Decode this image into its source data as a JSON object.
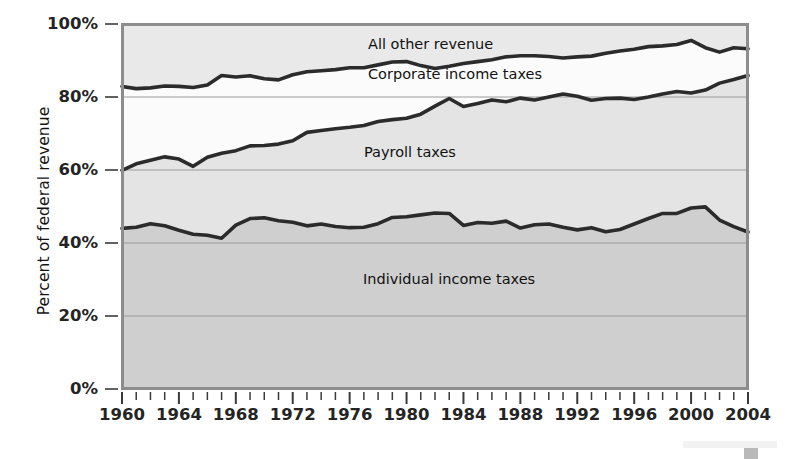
{
  "figure": {
    "background_color": "#ffffff",
    "plot_area": {
      "left": 122,
      "top": 24,
      "right": 748,
      "bottom": 389
    },
    "border_color": "#8d8d8d",
    "gridline_color": "#9a9a9a",
    "line_color": "#2b2b2b"
  },
  "axes": {
    "y_title": "Percent of federal revenue",
    "y_ticks": [
      "0%",
      "20%",
      "40%",
      "60%",
      "80%",
      "100%"
    ],
    "y_tick_values": [
      0,
      20,
      40,
      60,
      80,
      100
    ],
    "x_ticks": [
      "1960",
      "1964",
      "1968",
      "1972",
      "1976",
      "1980",
      "1984",
      "1988",
      "1992",
      "1996",
      "2000",
      "2004"
    ],
    "x_tick_values": [
      1960,
      1964,
      1968,
      1972,
      1976,
      1980,
      1984,
      1988,
      1992,
      1996,
      2000,
      2004
    ],
    "x_minor_tick_step": 1
  },
  "bands": [
    {
      "name": "individual-income-taxes",
      "label": "Individual income taxes",
      "fill": "#cfcfcf",
      "label_x": 363,
      "label_y": 272
    },
    {
      "name": "payroll-taxes",
      "label": "Payroll taxes",
      "fill": "#e4e4e4",
      "label_x": 364,
      "label_y": 145
    },
    {
      "name": "corporate-income-taxes",
      "label": "Corporate income taxes",
      "fill": "#fbfbfb",
      "label_x": 368,
      "label_y": 67
    },
    {
      "name": "all-other-revenue",
      "label": "All other revenue",
      "fill": "#e9e9e9",
      "label_x": 368,
      "label_y": 37
    }
  ],
  "chart_data": {
    "type": "area",
    "title": "",
    "subtitle": "",
    "xlabel": "",
    "ylabel": "Percent of federal revenue",
    "xlim": [
      1960,
      2004
    ],
    "ylim": [
      0,
      100
    ],
    "grid": true,
    "stacked": true,
    "legend_position": "inline-labels",
    "x": [
      1960,
      1961,
      1962,
      1963,
      1964,
      1965,
      1966,
      1967,
      1968,
      1969,
      1970,
      1971,
      1972,
      1973,
      1974,
      1975,
      1976,
      1977,
      1978,
      1979,
      1980,
      1981,
      1982,
      1983,
      1984,
      1985,
      1986,
      1987,
      1988,
      1989,
      1990,
      1991,
      1992,
      1993,
      1994,
      1995,
      1996,
      1997,
      1998,
      1999,
      2000,
      2001,
      2002,
      2003,
      2004
    ],
    "annotations": [
      {
        "text": "All other revenue",
        "x": 1977,
        "y": 95
      },
      {
        "text": "Corporate income taxes",
        "x": 1977,
        "y": 87
      },
      {
        "text": "Payroll taxes",
        "x": 1977,
        "y": 67
      },
      {
        "text": "Individual income taxes",
        "x": 1977,
        "y": 32
      }
    ],
    "cumulative_boundaries": {
      "individual_top": [
        44.0,
        44.3,
        45.3,
        44.7,
        43.5,
        42.4,
        42.1,
        41.3,
        44.9,
        46.7,
        46.9,
        46.1,
        45.7,
        44.7,
        45.2,
        44.5,
        44.2,
        44.3,
        45.3,
        47.0,
        47.2,
        47.7,
        48.2,
        48.1,
        44.8,
        45.6,
        45.4,
        46.0,
        44.1,
        45.0,
        45.2,
        44.3,
        43.6,
        44.2,
        43.1,
        43.7,
        45.2,
        46.7,
        48.1,
        48.1,
        49.6,
        49.9,
        46.3,
        44.5,
        43.0
      ],
      "payroll_top": [
        59.9,
        61.7,
        62.7,
        63.6,
        63.0,
        61.0,
        63.5,
        64.6,
        65.3,
        66.6,
        66.7,
        67.1,
        68.0,
        70.3,
        70.8,
        71.3,
        71.7,
        72.2,
        73.3,
        73.8,
        74.2,
        75.3,
        77.5,
        79.6,
        77.4,
        78.2,
        79.2,
        78.7,
        79.7,
        79.2,
        80.0,
        80.8,
        80.2,
        79.1,
        79.6,
        79.7,
        79.3,
        80.0,
        80.8,
        81.5,
        81.1,
        81.9,
        83.8,
        84.8,
        85.9
      ],
      "corporate_top": [
        82.9,
        82.3,
        82.5,
        83.0,
        82.9,
        82.6,
        83.3,
        85.9,
        85.5,
        85.8,
        85.0,
        84.7,
        86.1,
        86.9,
        87.2,
        87.5,
        88.0,
        88.0,
        88.8,
        89.6,
        89.7,
        88.6,
        87.8,
        88.4,
        89.2,
        89.7,
        90.2,
        91.0,
        91.3,
        91.3,
        91.1,
        90.7,
        91.0,
        91.2,
        92.0,
        92.6,
        93.1,
        93.8,
        94.0,
        94.4,
        95.5,
        93.5,
        92.3,
        93.5,
        93.2
      ]
    },
    "series": [
      {
        "name": "Individual income taxes",
        "fill": "#cfcfcf"
      },
      {
        "name": "Payroll taxes",
        "fill": "#e4e4e4"
      },
      {
        "name": "Corporate income taxes",
        "fill": "#fbfbfb"
      },
      {
        "name": "All other revenue",
        "fill": "#e9e9e9"
      }
    ]
  }
}
